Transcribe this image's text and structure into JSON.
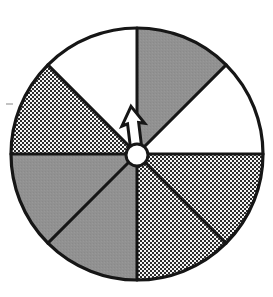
{
  "figure": {
    "kind": "spinner-wheel-diagram",
    "canvas": {
      "width": 273,
      "height": 297,
      "background": "#ffffff"
    }
  },
  "wheel": {
    "center_x": 137,
    "center_y": 154,
    "radius": 126,
    "sector_count": 8,
    "sector_angle_degrees": 45,
    "start_angle_degrees": -90,
    "outline_color": "#161616",
    "outline_width": 3.2,
    "spoke_color": "#161616",
    "spoke_width": 3.0
  },
  "fills": {
    "solid_gray": "#8f8f8f",
    "white": "#ffffff",
    "texture_dark_dot": "#2a2a2a",
    "texture_background": "#f2f2f2",
    "outline": "#161616"
  },
  "sectors": [
    {
      "index": 0,
      "name": "sector-1",
      "label": "1",
      "start_deg": -90,
      "end_deg": -45,
      "fill": "solid_gray",
      "fill_name": "solid gray"
    },
    {
      "index": 1,
      "name": "sector-2",
      "label": "2",
      "start_deg": -45,
      "end_deg": 0,
      "fill": "white",
      "fill_name": "white"
    },
    {
      "index": 2,
      "name": "sector-3",
      "label": "3",
      "start_deg": 0,
      "end_deg": 45,
      "fill": "texture",
      "fill_name": "crosshatch texture"
    },
    {
      "index": 3,
      "name": "sector-4",
      "label": "4",
      "start_deg": 45,
      "end_deg": 90,
      "fill": "texture",
      "fill_name": "crosshatch texture"
    },
    {
      "index": 4,
      "name": "sector-5",
      "label": "5",
      "start_deg": 90,
      "end_deg": 135,
      "fill": "solid_gray",
      "fill_name": "solid gray"
    },
    {
      "index": 5,
      "name": "sector-6",
      "label": "6",
      "start_deg": 135,
      "end_deg": 180,
      "fill": "solid_gray",
      "fill_name": "solid gray"
    },
    {
      "index": 6,
      "name": "sector-7",
      "label": "7",
      "start_deg": 180,
      "end_deg": 225,
      "fill": "texture",
      "fill_name": "crosshatch texture"
    },
    {
      "index": 7,
      "name": "sector-8",
      "label": "8",
      "start_deg": 225,
      "end_deg": 270,
      "fill": "white",
      "fill_name": "white"
    }
  ],
  "pointer": {
    "name": "spinner-arrow",
    "description": "white arrow with black outline pointing up and slightly left",
    "direction_degrees": -97,
    "length": 46,
    "fill": "#ffffff",
    "stroke": "#161616",
    "stroke_width": 3.0
  },
  "hub": {
    "name": "spinner-hub",
    "center_x": 137,
    "center_y": 155,
    "radius": 11,
    "fill": "#ffffff",
    "stroke": "#161616",
    "stroke_width": 3.0
  },
  "artifacts": [
    {
      "name": "scan-speck",
      "x": 6,
      "y": 103,
      "width": 7,
      "height": 2
    }
  ]
}
